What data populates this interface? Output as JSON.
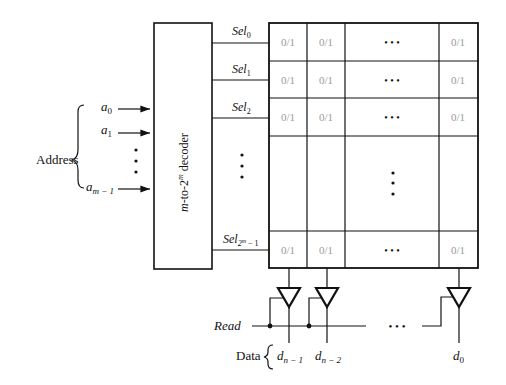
{
  "address": {
    "label": "Address",
    "inputs": [
      {
        "base": "a",
        "sub": "0"
      },
      {
        "base": "a",
        "sub": "1"
      },
      {
        "base": "a",
        "sub": "m − 1"
      }
    ]
  },
  "decoder": {
    "label_pre": "m",
    "label_mid": "-to-2",
    "label_sup": "m",
    "label_post": " decoder"
  },
  "select_lines": [
    {
      "base": "Sel",
      "sub": "0"
    },
    {
      "base": "Sel",
      "sub": "1"
    },
    {
      "base": "Sel",
      "sub": "2"
    },
    {
      "base": "Sel",
      "sub": "2",
      "sup": "m",
      "tail": " − 1"
    }
  ],
  "cell_value": "0/1",
  "grid": {
    "rows": [
      [
        "0/1",
        "0/1",
        "• • •",
        "0/1"
      ],
      [
        "0/1",
        "0/1",
        "• • •",
        "0/1"
      ],
      [
        "0/1",
        "0/1",
        "• • •",
        "0/1"
      ],
      [
        "",
        "",
        "⋮",
        ""
      ],
      [
        "0/1",
        "0/1",
        "• • •",
        "0/1"
      ]
    ]
  },
  "read": {
    "label": "Read"
  },
  "data": {
    "label": "Data",
    "outputs": [
      {
        "base": "d",
        "sub": "n − 1"
      },
      {
        "base": "d",
        "sub": "n − 2"
      },
      {
        "base": "d",
        "sub": "0"
      }
    ],
    "ellipsis": "• • •"
  }
}
